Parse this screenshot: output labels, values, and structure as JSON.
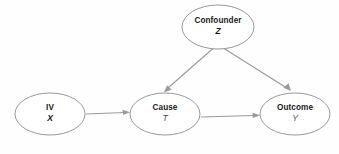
{
  "diagram": {
    "type": "directed-acyclic-graph",
    "background_color": "#fefefe",
    "node_fill_color": "#ffffff",
    "node_border_color": "#8d8d8d",
    "edge_color": "#9a9a9a",
    "nodes": [
      {
        "id": "iv",
        "name": "IV",
        "variable": "X",
        "variable_style": "bold-italic",
        "cx": 50,
        "cy": 114,
        "rx": 35,
        "ry": 21
      },
      {
        "id": "cause",
        "name": "Cause",
        "variable": "T",
        "variable_style": "italic",
        "cx": 165,
        "cy": 114,
        "rx": 35,
        "ry": 21
      },
      {
        "id": "outcome",
        "name": "Outcome",
        "variable": "Y",
        "variable_style": "italic",
        "cx": 295,
        "cy": 114,
        "rx": 35,
        "ry": 21
      },
      {
        "id": "confounder",
        "name": "Confounder",
        "variable": "Z",
        "variable_style": "bold-italic",
        "cx": 218,
        "cy": 27,
        "rx": 36,
        "ry": 22
      }
    ],
    "edges": [
      {
        "id": "iv-to-cause",
        "from": "IV",
        "to": "Cause",
        "direction": "right",
        "arrowhead": true
      },
      {
        "id": "cause-to-outcome",
        "from": "Cause",
        "to": "Outcome",
        "direction": "right",
        "arrowhead": true
      },
      {
        "id": "confounder-to-cause",
        "from": "Confounder",
        "to": "Cause",
        "direction": "down-left",
        "arrowhead": true
      },
      {
        "id": "confounder-to-outcome",
        "from": "Confounder",
        "to": "Outcome",
        "direction": "down-right",
        "arrowhead": true
      }
    ]
  }
}
